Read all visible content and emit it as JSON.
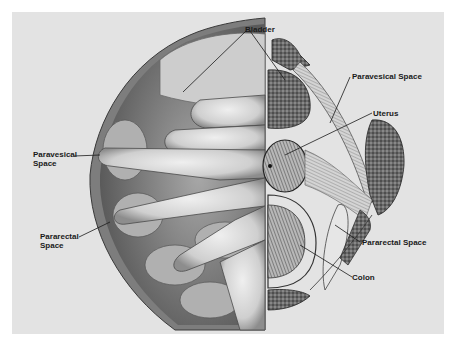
{
  "figure": {
    "type": "anatomical-illustration",
    "colors": {
      "background": "#ffffff",
      "panel": "#e3e3e3",
      "ink": "#1a1a1a",
      "bone": "#555555",
      "tissue": "#cfcfcf"
    }
  },
  "labels": {
    "bladder": "Bladder",
    "paravesical_left": "Paravesical\nSpace",
    "pararectal_left": "Pararectal\nSpace",
    "paravesical_right": "Paravesical Space",
    "uterus": "Uterus",
    "pararectal_right": "Pararectal Space",
    "colon": "Colon"
  }
}
